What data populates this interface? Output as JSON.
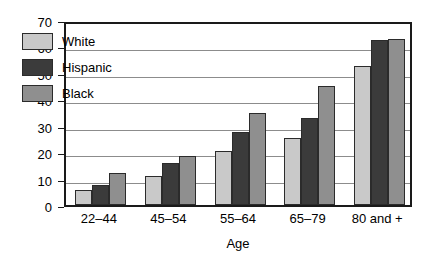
{
  "chart_data": {
    "type": "bar",
    "title": "",
    "xlabel": "Age",
    "ylabel": "Percent",
    "categories": [
      "22–44",
      "45–54",
      "55–64",
      "65–79",
      "80 and +"
    ],
    "series": [
      {
        "name": "White",
        "values": [
          5.5,
          11,
          20.5,
          25.5,
          52.5
        ],
        "color": "#c9c9c9"
      },
      {
        "name": "Hispanic",
        "values": [
          7.5,
          16,
          27.5,
          33,
          62.5
        ],
        "color": "#3b3b3b"
      },
      {
        "name": "Black",
        "values": [
          12,
          18.5,
          35,
          45,
          63
        ],
        "color": "#8f8f8f"
      }
    ],
    "ylim": [
      0,
      70
    ],
    "yticks": [
      0,
      10,
      20,
      30,
      40,
      50,
      60,
      70
    ],
    "ytick_labels": [
      "0",
      "10",
      "20",
      "30",
      "40",
      "50",
      "60",
      "70"
    ],
    "grid": true,
    "legend_position": "upper left"
  },
  "legend": {
    "items": [
      {
        "label": "White"
      },
      {
        "label": "Hispanic"
      },
      {
        "label": "Black"
      }
    ]
  },
  "axes": {
    "y_title": "Percent",
    "x_title": "Age"
  }
}
